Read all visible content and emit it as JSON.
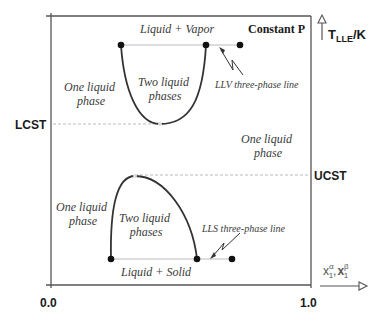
{
  "title": "Constant P",
  "axes": {
    "y_label_main": "T",
    "y_label_sub": "LLE",
    "y_label_unit": "/K",
    "x_label": "x",
    "x_label_sup_alpha": "α",
    "x_label_sup_beta": "β",
    "x_label_sub": "1",
    "x_label_sep": ",",
    "x_tick_min": "0.0",
    "x_tick_max": "1.0"
  },
  "markers": {
    "lcst": "LCST",
    "ucst": "UCST"
  },
  "regions": {
    "liquid_vapor": "Liquid + Vapor",
    "liquid_solid": "Liquid + Solid",
    "upper_left_one_liquid_1": "One liquid",
    "upper_left_one_liquid_2": "phase",
    "upper_two_liquid_1": "Two liquid",
    "upper_two_liquid_2": "phases",
    "right_one_liquid_1": "One liquid",
    "right_one_liquid_2": "phase",
    "lower_left_one_liquid_1": "One liquid",
    "lower_left_one_liquid_2": "phase",
    "lower_two_liquid_1": "Two liquid",
    "lower_two_liquid_2": "phases"
  },
  "annotations": {
    "llv_line": "LLV three-phase line",
    "lls_line": "LLS three-phase line"
  },
  "colors": {
    "axis": "#555555",
    "curve": "#333333",
    "dotted": "#bbbbbb",
    "point": "#111111"
  }
}
